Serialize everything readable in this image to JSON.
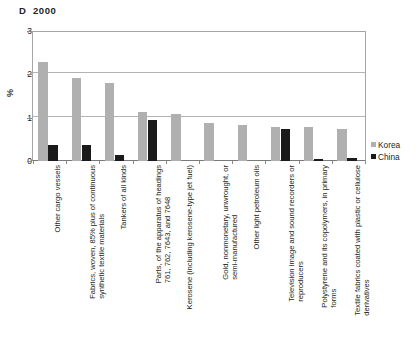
{
  "chart_data": {
    "type": "bar",
    "title": "D  2000",
    "xlabel": "",
    "ylabel": "%",
    "ylim": [
      0,
      3
    ],
    "yticks": [
      "0",
      "1",
      "2",
      "3"
    ],
    "grid": true,
    "legend_position": "right",
    "categories": [
      "Other cargo vessels",
      "Fabrics, woven, 85% plus of continuous synthetic textile materials",
      "Tankers of all kinds",
      "Parts, of the apparatus of headings 761, 762, 7643, and 7648",
      "Kerosene (including kerosene-type jet fuel)",
      "Gold, nonmonetary, unwrought, or semi-manufactured",
      "Other light petroleum oils",
      "Television image and sound recorders or reproducers",
      "Polystyrene and its copolymers, in primary forms",
      "Textile fabrics coated with plastic or cellulose derivatives"
    ],
    "category_lines": [
      [
        "Other cargo vessels"
      ],
      [
        "Fabrics, woven, 85% plus of continuous",
        "synthetic textile materials"
      ],
      [
        "Tankers of all kinds"
      ],
      [
        "Parts, of the apparatus of headings",
        "761, 762, 7643, and 7648"
      ],
      [
        "Kerosene (including kerosene-type jet fuel)"
      ],
      [
        "Gold, nonmonetary, unwrought, or",
        "semi-manufactured"
      ],
      [
        "Other light petroleum oils"
      ],
      [
        "Television image and sound recorders or",
        "reproducers"
      ],
      [
        "Polystyrene and its copolymers, in primary",
        "forms"
      ],
      [
        "Textile fabrics coated with plastic or cellulose",
        "derivatives"
      ]
    ],
    "series": [
      {
        "name": "Korea",
        "color": "#b0b0b0",
        "values": [
          2.28,
          1.92,
          1.8,
          1.14,
          1.08,
          0.87,
          0.83,
          0.78,
          0.78,
          0.73
        ]
      },
      {
        "name": "China",
        "color": "#1a1a1a",
        "values": [
          0.37,
          0.38,
          0.14,
          0.94,
          0.0,
          0.0,
          0.0,
          0.73,
          0.04,
          0.08
        ]
      }
    ]
  },
  "legend": {
    "items": [
      {
        "label": "Korea",
        "color": "#b0b0b0"
      },
      {
        "label": "China",
        "color": "#1a1a1a"
      }
    ]
  }
}
